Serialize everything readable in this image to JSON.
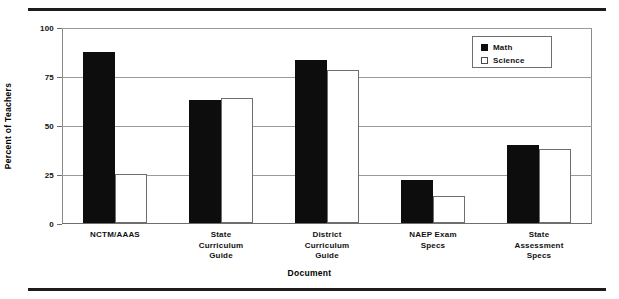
{
  "chart_data": {
    "type": "bar",
    "title": "",
    "xlabel": "Document",
    "ylabel": "Percent of Teachers",
    "ylim": [
      0,
      100
    ],
    "yticks": [
      0,
      25,
      50,
      75,
      100
    ],
    "ytick_labels": [
      "0",
      "25",
      "50",
      "75",
      "100"
    ],
    "grid": true,
    "legend_position": "upper right",
    "categories": [
      "NCTM/AAAS",
      "State Curriculum Guide",
      "District Curriculum Guide",
      "NAEP Exam Specs",
      "State Assessment Specs"
    ],
    "category_lines": [
      [
        "NCTM/AAAS"
      ],
      [
        "State",
        "Curriculum",
        "Guide"
      ],
      [
        "District",
        "Curriculum",
        "Guide"
      ],
      [
        "NAEP Exam",
        "Specs"
      ],
      [
        "State",
        "Assessment",
        "Specs"
      ]
    ],
    "series": [
      {
        "name": "Math",
        "color": "#0d0d0d",
        "values": [
          87,
          63,
          83,
          22,
          40
        ]
      },
      {
        "name": "Science",
        "color": "#ffffff",
        "values": [
          25,
          64,
          78,
          14,
          38
        ]
      }
    ]
  },
  "legend": {
    "items": [
      {
        "label": "Math",
        "swatch": "filled-square-icon"
      },
      {
        "label": "Science",
        "swatch": "open-square-icon"
      }
    ]
  },
  "axes": {
    "y_title": "Percent of Teachers",
    "x_title": "Document",
    "y_tick_0": "0",
    "y_tick_25": "25",
    "y_tick_50": "50",
    "y_tick_75": "75",
    "y_tick_100": "100"
  }
}
